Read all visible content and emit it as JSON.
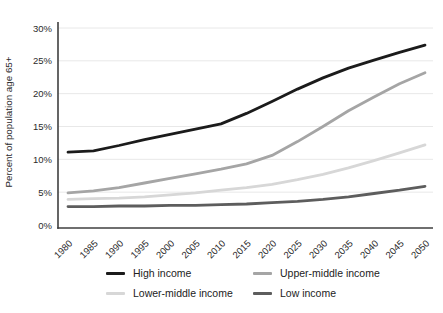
{
  "chart_data": {
    "type": "line",
    "title": "",
    "xlabel": "",
    "ylabel": "Percent of population age 65+",
    "x": [
      1980,
      1985,
      1990,
      1995,
      2000,
      2005,
      2010,
      2015,
      2020,
      2025,
      2030,
      2035,
      2040,
      2045,
      2050
    ],
    "x_tick_labels": [
      "1980",
      "1985",
      "1990",
      "1995",
      "2000",
      "2005",
      "2010",
      "2015",
      "2020",
      "2025",
      "2030",
      "2035",
      "2040",
      "2045",
      "2050"
    ],
    "y_ticks": [
      0,
      5,
      10,
      15,
      20,
      25,
      30
    ],
    "y_tick_labels": [
      "0%",
      "5%",
      "10%",
      "15%",
      "20%",
      "25%",
      "30%"
    ],
    "ylim": [
      0,
      30
    ],
    "grid": "horizontal",
    "legend_position": "bottom",
    "series": [
      {
        "name": "High income",
        "color": "#1b1b1b",
        "values": [
          11.1,
          11.3,
          12.1,
          13.0,
          13.8,
          14.6,
          15.4,
          17.0,
          18.8,
          20.7,
          22.4,
          23.9,
          25.1,
          26.3,
          27.4
        ]
      },
      {
        "name": "Upper-middle income",
        "color": "#a5a5a5",
        "values": [
          4.9,
          5.2,
          5.7,
          6.4,
          7.1,
          7.8,
          8.5,
          9.3,
          10.6,
          12.7,
          15.0,
          17.4,
          19.5,
          21.5,
          23.2
        ]
      },
      {
        "name": "Lower-middle income",
        "color": "#d7d7d7",
        "values": [
          3.9,
          4.0,
          4.1,
          4.3,
          4.6,
          4.9,
          5.3,
          5.7,
          6.2,
          6.9,
          7.7,
          8.7,
          9.8,
          11.0,
          12.2
        ]
      },
      {
        "name": "Low income",
        "color": "#5d5d5d",
        "values": [
          2.8,
          2.8,
          2.9,
          2.9,
          3.0,
          3.0,
          3.1,
          3.2,
          3.4,
          3.6,
          3.9,
          4.3,
          4.8,
          5.3,
          5.9
        ]
      }
    ],
    "colors": {
      "axis": "#3f3f3f",
      "gridline": "#e8e8e8",
      "background": "#ffffff"
    }
  }
}
